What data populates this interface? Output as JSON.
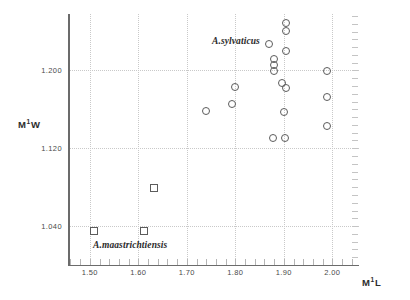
{
  "chart_data": {
    "type": "scatter",
    "title": "",
    "xlabel": "M1L",
    "ylabel": "M1W",
    "xlabel_base": "M",
    "xlabel_sup": "1",
    "xlabel_tail": "L",
    "ylabel_base": "M",
    "ylabel_sup": "1",
    "ylabel_tail": "W",
    "xlim": [
      1.455,
      2.055
    ],
    "ylim": [
      1.0,
      1.258
    ],
    "xticks": [
      1.5,
      1.6,
      1.7,
      1.8,
      1.9,
      2.0
    ],
    "xticklabels": [
      "1.50",
      "1.60",
      "1.70",
      "1.80",
      "1.90",
      "2.00"
    ],
    "yticks": [
      1.04,
      1.12,
      1.2
    ],
    "yticklabels": [
      "1.040",
      "1.120",
      "1.200"
    ],
    "grid": true,
    "grid_style": "dotted",
    "legend": "none",
    "annotations": [
      {
        "text": "A.sylvaticus",
        "x": 1.78,
        "y": 1.235
      },
      {
        "text": "A.maastrichtiensis",
        "x": 1.51,
        "y": 1.028
      }
    ],
    "series": [
      {
        "name": "A.sylvaticus",
        "marker": "circle",
        "color": "#5c5c5c",
        "points": [
          {
            "x": 1.905,
            "y": 1.2485
          },
          {
            "x": 1.905,
            "y": 1.2405
          },
          {
            "x": 1.87,
            "y": 1.2275
          },
          {
            "x": 1.905,
            "y": 1.22
          },
          {
            "x": 1.88,
            "y": 1.2115
          },
          {
            "x": 1.88,
            "y": 1.2055
          },
          {
            "x": 1.88,
            "y": 1.1995
          },
          {
            "x": 1.99,
            "y": 1.1995
          },
          {
            "x": 1.897,
            "y": 1.1875
          },
          {
            "x": 1.905,
            "y": 1.1815
          },
          {
            "x": 1.8,
            "y": 1.183
          },
          {
            "x": 1.988,
            "y": 1.1725
          },
          {
            "x": 1.793,
            "y": 1.1655
          },
          {
            "x": 1.74,
            "y": 1.158
          },
          {
            "x": 1.9,
            "y": 1.157
          },
          {
            "x": 1.988,
            "y": 1.1425
          },
          {
            "x": 1.877,
            "y": 1.1305
          },
          {
            "x": 1.903,
            "y": 1.1305
          }
        ]
      },
      {
        "name": "A.maastrichtiensis",
        "marker": "square",
        "color": "#5c5c5c",
        "points": [
          {
            "x": 1.632,
            "y": 1.079
          },
          {
            "x": 1.508,
            "y": 1.0345
          },
          {
            "x": 1.612,
            "y": 1.0345
          }
        ]
      }
    ]
  },
  "axes": {
    "x_title_parts": {
      "base": "M",
      "sup": "1",
      "tail": "L"
    },
    "y_title_parts": {
      "base": "M",
      "sup": "1",
      "tail": "W"
    }
  }
}
